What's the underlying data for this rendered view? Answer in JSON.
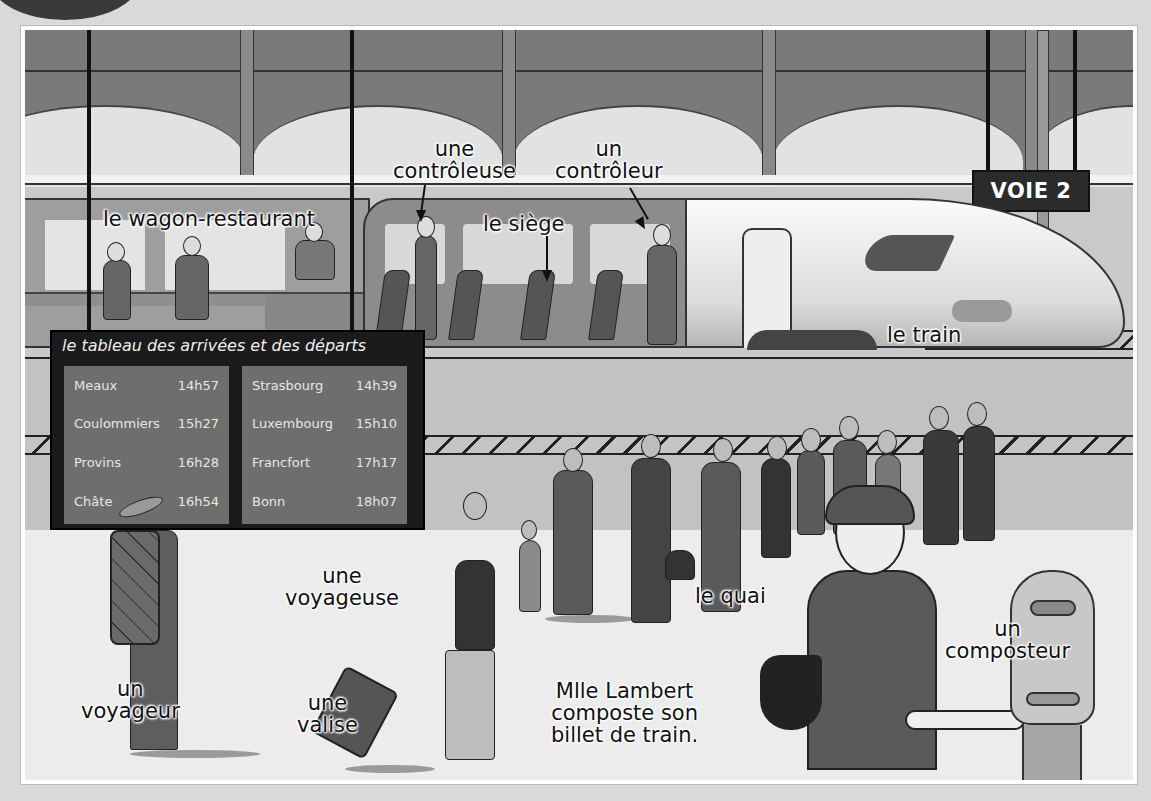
{
  "scene": {
    "title": "Train station vocabulary illustration",
    "sign": {
      "text": "VOIE 2"
    },
    "board": {
      "title": "le tableau des arrivées et des départs",
      "left_panel": [
        {
          "city": "Meaux",
          "time": "14h57"
        },
        {
          "city": "Coulommiers",
          "time": "15h27"
        },
        {
          "city": "Provins",
          "time": "16h28"
        },
        {
          "city": "Châte",
          "time": "16h54"
        }
      ],
      "right_panel": [
        {
          "city": "Strasbourg",
          "time": "14h39"
        },
        {
          "city": "Luxembourg",
          "time": "15h10"
        },
        {
          "city": "Francfort",
          "time": "17h17"
        },
        {
          "city": "Bonn",
          "time": "18h07"
        }
      ]
    },
    "labels": {
      "wagon_restaurant": "le wagon-restaurant",
      "controleuse_1": "une",
      "controleuse_2": "contrôleuse",
      "controleur_1": "un",
      "controleur_2": "contrôleur",
      "siege": "le siège",
      "train": "le train",
      "quai": "le quai",
      "voyageuse_1": "une",
      "voyageuse_2": "voyageuse",
      "voyageur_1": "un",
      "voyageur_2": "voyageur",
      "valise_1": "une",
      "valise_2": "valise",
      "caption_1": "Mlle Lambert",
      "caption_2": "composte son",
      "caption_3": "billet de train.",
      "composteur_1": "un",
      "composteur_2": "composteur"
    },
    "colors": {
      "background": "#d9d9d9",
      "roof": "#7a7a7a",
      "board": "#1b1b1b",
      "board_panel": "#6e6e6e",
      "sign": "#2b2b2b"
    }
  }
}
